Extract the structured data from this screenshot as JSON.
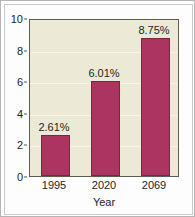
{
  "chart_data": {
    "type": "bar",
    "title": "",
    "xlabel": "Year",
    "ylabel": "",
    "categories": [
      "1995",
      "2020",
      "2069"
    ],
    "values": [
      2.61,
      6.01,
      8.75
    ],
    "data_labels": [
      "2.61%",
      "6.01%",
      "8.75%"
    ],
    "ylim": [
      0,
      10
    ],
    "yticks": [
      "0",
      "2",
      "4",
      "6",
      "8",
      "10"
    ],
    "ytick_values": [
      0,
      2,
      4,
      6,
      8,
      10
    ],
    "grid": true,
    "legend": false,
    "colors": {
      "bar_fill": "#ab3560",
      "bar_edge": "#7d2445",
      "plot_background": "#ece9d6",
      "plot_border": "#5d5c4e",
      "gridline": "#f7f5ea",
      "page_background": "#ffffff",
      "frame_border": "#b5b5b5",
      "text": "#23231f"
    }
  }
}
